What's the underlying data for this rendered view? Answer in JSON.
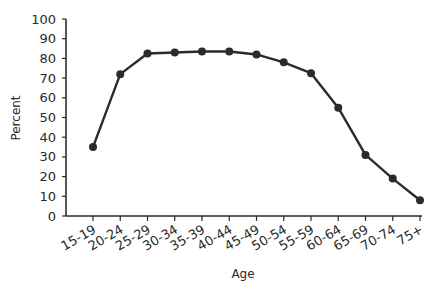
{
  "chart_data": {
    "type": "line",
    "title": "",
    "xlabel": "Age",
    "ylabel": "Percent",
    "ylim": [
      0,
      100
    ],
    "yticks": [
      0,
      10,
      20,
      30,
      40,
      50,
      60,
      70,
      80,
      90,
      100
    ],
    "categories": [
      "15-19",
      "20-24",
      "25-29",
      "30-34",
      "35-39",
      "40-44",
      "45-49",
      "50-54",
      "55-59",
      "60-64",
      "65-69",
      "70-74",
      "75+"
    ],
    "values": [
      35,
      72,
      82.5,
      83,
      83.5,
      83.5,
      82,
      78,
      72.5,
      55,
      31,
      19,
      8
    ],
    "grid": false,
    "legend": null,
    "line_color": "#2b2b2b"
  }
}
